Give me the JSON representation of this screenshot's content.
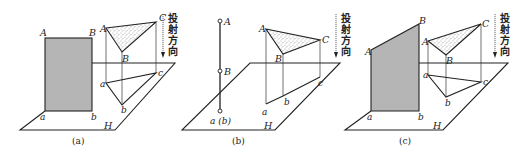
{
  "figure": {
    "panels": [
      {
        "id": "a",
        "caption": "(a)",
        "plane_label": "H",
        "rect_labels": {
          "A": "A",
          "B": "B",
          "a": "a",
          "b": "b"
        },
        "triangle_labels": {
          "A": "A",
          "B": "B",
          "C": "C"
        },
        "projection_labels": {
          "a": "a",
          "b": "b",
          "c": "c"
        },
        "direction_text": [
          "投",
          "射",
          "方",
          "向"
        ]
      },
      {
        "id": "b",
        "caption": "(b)",
        "plane_label": "H",
        "line_labels": {
          "A": "A",
          "B": "B",
          "ab": "a (b)"
        },
        "triangle_labels": {
          "A": "A",
          "B": "B",
          "C": "C"
        },
        "projection_labels": {
          "a": "a",
          "b": "b",
          "c": "c"
        },
        "direction_text": [
          "投",
          "射",
          "方",
          "向"
        ]
      },
      {
        "id": "c",
        "caption": "(c)",
        "plane_label": "H",
        "rect_labels": {
          "A": "A",
          "B": "B",
          "a": "a",
          "b": "b"
        },
        "triangle_labels": {
          "A": "A",
          "B": "B",
          "C": "C"
        },
        "projection_labels": {
          "a": "a",
          "b": "b",
          "c": "c"
        },
        "direction_text": [
          "投",
          "射",
          "方",
          "向"
        ]
      }
    ],
    "colors": {
      "line": "#222222",
      "background": "#ffffff",
      "hatch": "#555555",
      "stipple": "#777777"
    }
  }
}
